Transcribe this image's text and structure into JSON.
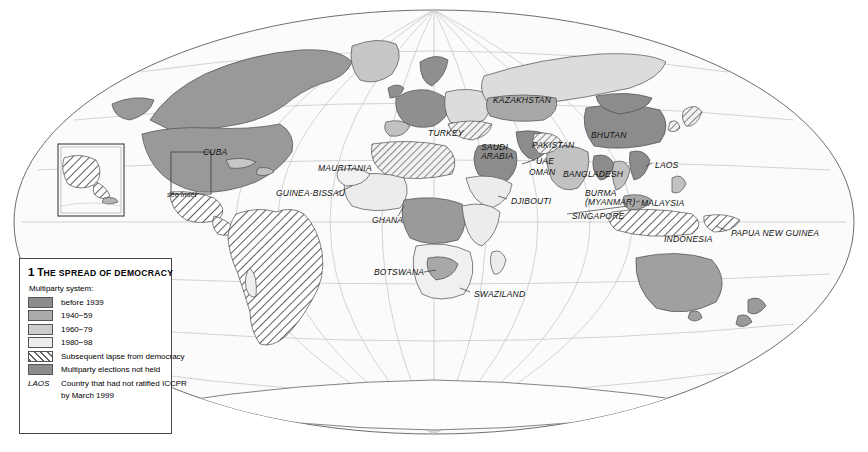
{
  "map": {
    "projection": "oval-world",
    "ocean_color": "#fbfbfb",
    "graticule_color": "#b9b9b9",
    "outline_color": "#6e6e6e",
    "border_color": "#555555",
    "inset_note": "see inset",
    "labels": [
      {
        "name": "CUBA",
        "text": "CUBA",
        "x": 203,
        "y": 148
      },
      {
        "name": "see-inset-note",
        "text": "see inset",
        "x": 167,
        "y": 190,
        "small": true
      },
      {
        "name": "MAURITANIA",
        "text": "MAURITANIA",
        "x": 318,
        "y": 164
      },
      {
        "name": "GUINEA-BISSAU",
        "text": "GUINEA-BISSAU",
        "x": 276,
        "y": 189
      },
      {
        "name": "GHANA",
        "text": "GHANA",
        "x": 372,
        "y": 216
      },
      {
        "name": "BOTSWANA",
        "text": "BOTSWANA",
        "x": 374,
        "y": 268
      },
      {
        "name": "SWAZILAND",
        "text": "SWAZILAND",
        "x": 474,
        "y": 290
      },
      {
        "name": "TURKEY",
        "text": "TURKEY",
        "x": 428,
        "y": 129
      },
      {
        "name": "KAZAKHSTAN",
        "text": "KAZAKHSTAN",
        "x": 493,
        "y": 96
      },
      {
        "name": "SAUDI-ARABIA",
        "text": "SAUDI\nARABIA",
        "x": 481,
        "y": 143
      },
      {
        "name": "UAE",
        "text": "UAE",
        "x": 536,
        "y": 157
      },
      {
        "name": "OMAN",
        "text": "OMAN",
        "x": 529,
        "y": 168
      },
      {
        "name": "DJIBOUTI",
        "text": "DJIBOUTI",
        "x": 511,
        "y": 197
      },
      {
        "name": "PAKISTAN",
        "text": "PAKISTAN",
        "x": 532,
        "y": 141
      },
      {
        "name": "BHUTAN",
        "text": "BHUTAN",
        "x": 591,
        "y": 131
      },
      {
        "name": "BANGLADESH",
        "text": "BANGLADESH",
        "x": 563,
        "y": 170
      },
      {
        "name": "BURMA-MYANMAR",
        "text": "BURMA\n(MYANMAR)",
        "x": 585,
        "y": 189
      },
      {
        "name": "LAOS",
        "text": "LAOS",
        "x": 655,
        "y": 161
      },
      {
        "name": "MALAYSIA",
        "text": "MALAYSIA",
        "x": 641,
        "y": 199
      },
      {
        "name": "SINGAPORE",
        "text": "SINGAPORE",
        "x": 572,
        "y": 212
      },
      {
        "name": "INDONESIA",
        "text": "INDONESIA",
        "x": 664,
        "y": 235
      },
      {
        "name": "PAPUA-NEW-GUINEA",
        "text": "PAPUA NEW GUINEA",
        "x": 731,
        "y": 229
      }
    ]
  },
  "legend": {
    "number": "1",
    "title_first": "T",
    "title_rest": "HE SPREAD OF DEMOCRACY",
    "subtitle": "Multiparty system:",
    "items": [
      {
        "name": "before-1939",
        "label": "before 1939",
        "color": "#8c8c8c",
        "type": "swatch"
      },
      {
        "name": "1940-59",
        "label": "1940−59",
        "color": "#ababab",
        "type": "swatch"
      },
      {
        "name": "1960-79",
        "label": "1960−79",
        "color": "#cccccc",
        "type": "swatch"
      },
      {
        "name": "1980-98",
        "label": "1980−98",
        "color": "#ededed",
        "type": "swatch"
      },
      {
        "name": "lapse",
        "label": "Subsequent lapse from democracy",
        "color": "#ffffff",
        "type": "hatch"
      },
      {
        "name": "no-elections",
        "label": "Multiparty elections not held",
        "color": "#8c8c8c",
        "type": "swatch"
      }
    ],
    "code_row": {
      "code": "LAOS",
      "line1": "Country that had not ratified ICCPR",
      "line2": "by March 1999"
    }
  }
}
